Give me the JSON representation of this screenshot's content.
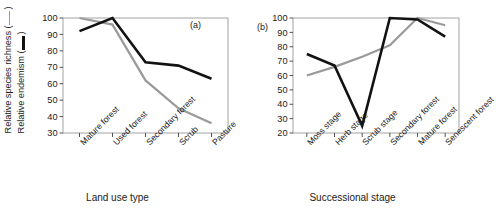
{
  "figure": {
    "ylabel_lines": [
      "Relative species richness (",
      "Relative endemism ("
    ],
    "ylabel_close": ")",
    "legend": [
      {
        "name": "Relative species richness",
        "marker": "thin-gray-line",
        "color": "#9a9a9a"
      },
      {
        "name": "Relative endemism",
        "marker": "thick-black-line",
        "color": "#121212"
      }
    ]
  },
  "chart_data": [
    {
      "type": "line",
      "panel_tag": "(a)",
      "title": "",
      "xlabel": "Land use type",
      "ylabel": "Relative species richness ( ) / Relative endemism ( )",
      "categories": [
        "Mature forest",
        "Used forest",
        "Secondary forest",
        "Scrub",
        "Pasture"
      ],
      "yticks": [
        30,
        40,
        50,
        60,
        70,
        80,
        90,
        100
      ],
      "ylim": [
        30,
        100
      ],
      "grid": false,
      "legend_position": "y-axis-label",
      "series": [
        {
          "name": "Relative endemism",
          "color": "#121212",
          "width": 2.6,
          "values": [
            92,
            100,
            73,
            71,
            63
          ]
        },
        {
          "name": "Relative species richness",
          "color": "#9a9a9a",
          "width": 2.2,
          "values": [
            100,
            96,
            62,
            45,
            36
          ]
        }
      ]
    },
    {
      "type": "line",
      "panel_tag": "(b)",
      "title": "",
      "xlabel": "Successional stage",
      "ylabel": "Relative species richness ( ) / Relative endemism ( )",
      "categories": [
        "Moss stage",
        "Herb stage",
        "Scrub stage",
        "Secondary forest",
        "Mature forest",
        "Senescent forest"
      ],
      "yticks": [
        20,
        30,
        40,
        50,
        60,
        70,
        80,
        90,
        100
      ],
      "ylim": [
        20,
        100
      ],
      "grid": false,
      "legend_position": "y-axis-label",
      "series": [
        {
          "name": "Relative endemism",
          "color": "#121212",
          "width": 2.6,
          "values": [
            75,
            67,
            25,
            100,
            99,
            87
          ]
        },
        {
          "name": "Relative species richness",
          "color": "#9a9a9a",
          "width": 2.2,
          "values": [
            60,
            66,
            73,
            81,
            100,
            95
          ]
        }
      ]
    }
  ]
}
